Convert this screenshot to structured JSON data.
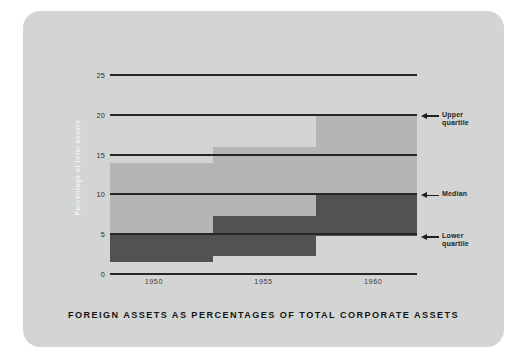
{
  "caption": "FOREIGN ASSETS AS PERCENTAGES OF TOTAL CORPORATE ASSETS",
  "axes": {
    "ylabel": "Percentage of total assets",
    "yticks": [
      "0",
      "5",
      "10",
      "15",
      "20",
      "25"
    ],
    "xticks": [
      "1950",
      "1955",
      "1960"
    ]
  },
  "annotations": {
    "upper": {
      "line1": "Upper",
      "line2": "quartile"
    },
    "median": {
      "line1": "Median",
      "line2": ""
    },
    "lower": {
      "line1": "Lower",
      "line2": "quartile"
    }
  },
  "colors": {
    "card": "#d3d4d4",
    "band_upper": "#b5b5b5",
    "band_lower": "#525252",
    "gridline": "#262626",
    "text": "#1f1f1f",
    "ylabel_text": "#f2f2f2"
  },
  "chart_data": {
    "type": "area",
    "title": "FOREIGN ASSETS AS PERCENTAGES OF TOTAL CORPORATE ASSETS",
    "xlabel": "",
    "ylabel": "Percentage of total assets",
    "ylim": [
      0,
      25
    ],
    "yticks": [
      0,
      5,
      10,
      15,
      20,
      25
    ],
    "xticks": [
      1950,
      1955,
      1960
    ],
    "xlim": [
      1948,
      1962
    ],
    "grid": true,
    "legend": "right-side annotations",
    "step_edges": [
      1948,
      1952.7,
      1957.4,
      1962
    ],
    "series": [
      {
        "name": "Upper quartile",
        "values": [
          14.0,
          16.0,
          20.0
        ]
      },
      {
        "name": "Median",
        "values": [
          5.0,
          7.3,
          10.0
        ]
      },
      {
        "name": "Lower quartile",
        "values": [
          1.5,
          2.3,
          4.8
        ]
      }
    ]
  }
}
